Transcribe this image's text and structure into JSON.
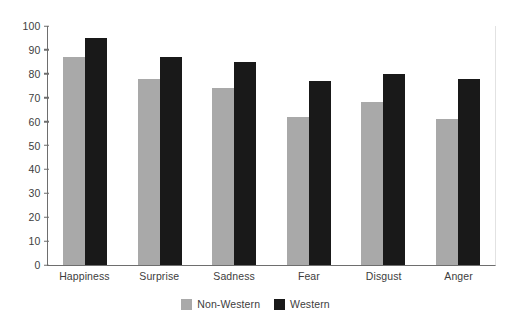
{
  "chart_data": {
    "type": "bar",
    "title": "",
    "subtitle": "",
    "xlabel": "",
    "ylabel": "",
    "categories": [
      "Happiness",
      "Surprise",
      "Sadness",
      "Fear",
      "Disgust",
      "Anger"
    ],
    "series": [
      {
        "name": "Non-Western",
        "color": "#a9a9a9",
        "values": [
          87,
          78,
          74,
          62,
          68,
          61
        ]
      },
      {
        "name": "Western",
        "color": "#191919",
        "values": [
          95,
          87,
          85,
          77,
          80,
          78
        ]
      }
    ],
    "ylim": [
      0,
      100
    ],
    "yticks": [
      0,
      10,
      20,
      30,
      40,
      50,
      60,
      70,
      80,
      90,
      100
    ],
    "ytick_labels": [
      "0",
      "10",
      "20",
      "30",
      "40",
      "50",
      "60",
      "70",
      "80",
      "90",
      "100"
    ],
    "grid": false,
    "legend_position": "bottom-center",
    "legend_entries": [
      "Non-Western",
      "Western"
    ],
    "annotations": []
  },
  "axes": {
    "y_axis_name": "y-axis",
    "x_axis_name": "x-axis"
  },
  "legend": {
    "items": [
      {
        "label": "Non-Western",
        "swatch": "legend-swatch-gray"
      },
      {
        "label": "Western",
        "swatch": "legend-swatch-black"
      }
    ]
  }
}
